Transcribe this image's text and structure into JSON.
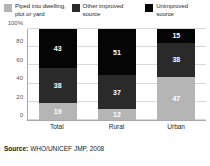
{
  "legend": {
    "items": [
      {
        "label": "Piped into dwelling, plot or yard",
        "color": "#b5b5b5",
        "key": "piped"
      },
      {
        "label": "Other improved source",
        "color": "#2a2a2a",
        "key": "other_improved"
      },
      {
        "label": "Unimproved source",
        "color": "#050505",
        "key": "unimproved"
      }
    ]
  },
  "axis": {
    "y_ticks": [
      "100%",
      "80",
      "60",
      "40",
      "20",
      "0"
    ],
    "x_ticks": [
      "Total",
      "Rural",
      "Urban"
    ]
  },
  "source": {
    "label": "Source:",
    "text": "WHO/UNICEF JMP, 2008"
  },
  "chart_data": {
    "type": "bar",
    "title": "",
    "subtitle": "",
    "xlabel": "",
    "ylabel": "",
    "ylim": [
      0,
      100
    ],
    "y_ticks": [
      0,
      20,
      40,
      60,
      80,
      100
    ],
    "y_tick_labels": [
      "0",
      "20",
      "40",
      "60",
      "80",
      "100%"
    ],
    "stacked": true,
    "percent": true,
    "grid": true,
    "legend_position": "top",
    "categories": [
      "Total",
      "Rural",
      "Urban"
    ],
    "series": [
      {
        "name": "Piped into dwelling, plot or yard",
        "color": "#b5b5b5",
        "values": [
          19,
          12,
          47
        ]
      },
      {
        "name": "Other improved source",
        "color": "#2a2a2a",
        "values": [
          38,
          37,
          38
        ]
      },
      {
        "name": "Unimproved source",
        "color": "#050505",
        "values": [
          43,
          51,
          15
        ]
      }
    ],
    "source": "WHO/UNICEF JMP, 2008"
  }
}
